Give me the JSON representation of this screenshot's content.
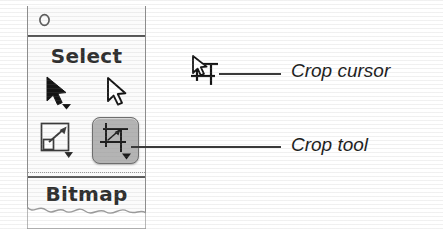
{
  "palette": {
    "titlebar": {
      "disclosure_icon": "circle-disclosure-icon"
    },
    "sections": [
      {
        "name": "select",
        "header": "Select",
        "tools": [
          {
            "id": "pointer",
            "icon": "filled-arrow-cursor-icon",
            "label": "Pointer tool",
            "selected": false,
            "has_dropdown": true
          },
          {
            "id": "subselection",
            "icon": "hollow-arrow-cursor-icon",
            "label": "Subselection tool",
            "selected": false,
            "has_dropdown": false
          },
          {
            "id": "scale",
            "icon": "scale-transform-icon",
            "label": "Scale tool",
            "selected": false,
            "has_dropdown": true
          },
          {
            "id": "crop",
            "icon": "crop-tool-icon",
            "label": "Crop tool",
            "selected": true,
            "has_dropdown": true
          }
        ]
      },
      {
        "name": "bitmap",
        "header": "Bitmap",
        "tools": []
      }
    ]
  },
  "callouts": [
    {
      "id": "crop-cursor",
      "text": "Crop cursor",
      "icon": "crop-cursor-icon"
    },
    {
      "id": "crop-tool",
      "text": "Crop tool",
      "icon": "crop-tool-icon"
    }
  ],
  "colors": {
    "selected_tool_background": "#b4b4b4",
    "selected_tool_border": "#6e6e6e",
    "panel_background": "#fbfbfb",
    "panel_border": "#8d8d8d",
    "ink": "#1c1c1c",
    "leader_line": "#3a3a3a"
  }
}
